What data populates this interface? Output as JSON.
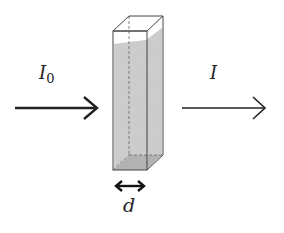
{
  "diagram": {
    "labels": {
      "incident_intensity": "I",
      "incident_subscript": "0",
      "transmitted_intensity": "I",
      "path_length": "d"
    },
    "colors": {
      "stroke": "#222222",
      "liquid": "#c8c8c8",
      "liquid_dark": "#a8a8a8",
      "cuvette_edge": "#555555",
      "background": "#ffffff"
    },
    "elements": [
      {
        "id": "incident-arrow",
        "from": [
          15,
          108
        ],
        "to": [
          97,
          108
        ]
      },
      {
        "id": "cuvette",
        "front": [
          113,
          31,
          147,
          170
        ],
        "depth_offset": [
          16,
          -15
        ]
      },
      {
        "id": "transmitted-arrow",
        "from": [
          182,
          108
        ],
        "to": [
          265,
          108
        ]
      },
      {
        "id": "path-length-arrow",
        "from": [
          115,
          186
        ],
        "to": [
          145,
          186
        ]
      }
    ]
  }
}
